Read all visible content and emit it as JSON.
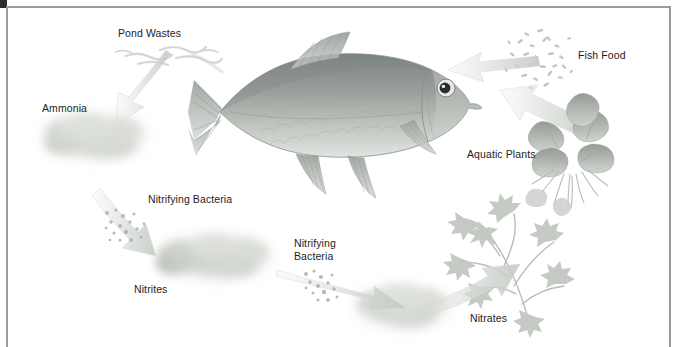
{
  "figure": {
    "style": "grayscale pencil and watercolor scientific illustration",
    "width": 678,
    "height": 347,
    "background_color": "#ffffff",
    "frame": {
      "rule_color": "#9b9b9b",
      "corner_block_color": "#2b2b2b"
    },
    "text_color": "#1d1d1d",
    "ink_color": "#a9adaa",
    "cloud_color": "#cfd3cd"
  },
  "labels": [
    {
      "id": "pond-wastes",
      "text": "Pond Wastes",
      "x": 118,
      "y": 27,
      "align": "left"
    },
    {
      "id": "ammonia",
      "text": "Ammonia",
      "x": 42,
      "y": 102,
      "align": "left"
    },
    {
      "id": "fish-food",
      "text": "Fish Food",
      "x": 578,
      "y": 49,
      "align": "left"
    },
    {
      "id": "aquatic-plants",
      "text": "Aquatic Plants",
      "x": 467,
      "y": 148,
      "align": "left"
    },
    {
      "id": "nitrifying-bacteria-1",
      "text": "Nitrifying Bacteria",
      "x": 148,
      "y": 193,
      "align": "left"
    },
    {
      "id": "nitrifying-bacteria-2",
      "text": "Nitrifying\nBacteria",
      "x": 294,
      "y": 237,
      "align": "left"
    },
    {
      "id": "nitrites",
      "text": "Nitrites",
      "x": 134,
      "y": 283,
      "align": "left"
    },
    {
      "id": "nitrates",
      "text": "Nitrates",
      "x": 470,
      "y": 312,
      "align": "left"
    }
  ],
  "cycle": {
    "description": "Clockwise-reading nitrogen cycle loop",
    "steps": [
      "Fish Food",
      "Fish",
      "Pond Wastes",
      "Ammonia",
      "Nitrifying Bacteria",
      "Nitrites",
      "Nitrifying Bacteria",
      "Nitrates",
      "Aquatic Plants"
    ]
  },
  "elements": {
    "fish": "central grayscale carp illustration facing right",
    "fish_food": "scatter of small flake particles, upper right",
    "aquatic_plants": "leafy rooted plant, right side",
    "plant_sprig": "feathery submerged sprig, lower right",
    "ammonia_cloud": "soft diffuse cloud, left",
    "nitrites_cloud": "soft diffuse cloud, lower left centre",
    "nitrates_cloud": "soft diffuse cloud, lower centre right",
    "bacteria_specks": "dotted speckle clusters beside arrows"
  }
}
